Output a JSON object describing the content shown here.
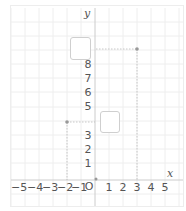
{
  "diagram": {
    "type": "coordinate-plane",
    "axes": {
      "x_label": "x",
      "y_label": "y",
      "origin_label": "O",
      "x_ticks": [
        "−5",
        "−4",
        "−3",
        "−2",
        "−1",
        "1",
        "2",
        "3",
        "4",
        "5"
      ],
      "y_ticks": [
        "1",
        "2",
        "3",
        "5",
        "6",
        "7",
        "8"
      ]
    },
    "points": [
      {
        "name": "point-a",
        "x": 3,
        "y": 9
      },
      {
        "name": "point-b",
        "x": -2,
        "y": 4
      },
      {
        "name": "origin",
        "x": 0,
        "y": 0
      }
    ],
    "answer_boxes": [
      {
        "name": "answer-box-y9",
        "for_value": "9",
        "content": ""
      },
      {
        "name": "answer-box-y4",
        "for_value": "4",
        "content": ""
      }
    ],
    "colors": {
      "grid": "#eeeeee",
      "axis": "#cccccc",
      "guide": "#bbbbbb",
      "point": "#999999",
      "text": "#555555"
    }
  }
}
